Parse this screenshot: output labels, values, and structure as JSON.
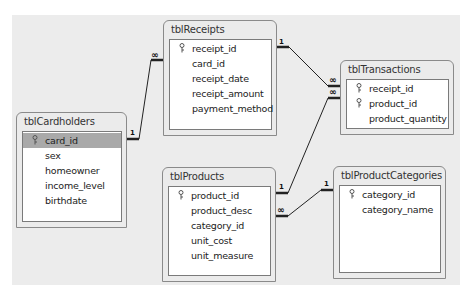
{
  "tables": {
    "cardholders": {
      "title": "tblCardholders",
      "fields": [
        {
          "name": "card_id",
          "primary_key": true,
          "selected": true
        },
        {
          "name": "sex",
          "primary_key": false
        },
        {
          "name": "homeowner",
          "primary_key": false
        },
        {
          "name": "income_level",
          "primary_key": false
        },
        {
          "name": "birthdate",
          "primary_key": false
        }
      ]
    },
    "receipts": {
      "title": "tblReceipts",
      "fields": [
        {
          "name": "receipt_id",
          "primary_key": true
        },
        {
          "name": "card_id",
          "primary_key": false
        },
        {
          "name": "receipt_date",
          "primary_key": false
        },
        {
          "name": "receipt_amount",
          "primary_key": false
        },
        {
          "name": "payment_method",
          "primary_key": false
        }
      ]
    },
    "transactions": {
      "title": "tblTransactions",
      "fields": [
        {
          "name": "receipt_id",
          "primary_key": true
        },
        {
          "name": "product_id",
          "primary_key": true
        },
        {
          "name": "product_quantity",
          "primary_key": false
        }
      ]
    },
    "products": {
      "title": "tblProducts",
      "fields": [
        {
          "name": "product_id",
          "primary_key": true
        },
        {
          "name": "product_desc",
          "primary_key": false
        },
        {
          "name": "category_id",
          "primary_key": false
        },
        {
          "name": "unit_cost",
          "primary_key": false
        },
        {
          "name": "unit_measure",
          "primary_key": false
        }
      ]
    },
    "product_categories": {
      "title": "tblProductCategories",
      "fields": [
        {
          "name": "category_id",
          "primary_key": true
        },
        {
          "name": "category_name",
          "primary_key": false
        }
      ]
    }
  },
  "relationships": [
    {
      "from": "tblCardholders.card_id",
      "from_label": "1",
      "to": "tblReceipts.card_id",
      "to_label": "∞"
    },
    {
      "from": "tblReceipts.receipt_id",
      "from_label": "1",
      "to": "tblTransactions.receipt_id",
      "to_label": "∞"
    },
    {
      "from": "tblProducts.product_id",
      "from_label": "1",
      "to": "tblTransactions.product_id",
      "to_label": "∞"
    },
    {
      "from": "tblProductCategories.category_id",
      "from_label": "1",
      "to": "tblProducts.category_id",
      "to_label": "∞"
    }
  ],
  "labels": {
    "one": "1",
    "many": "∞"
  }
}
